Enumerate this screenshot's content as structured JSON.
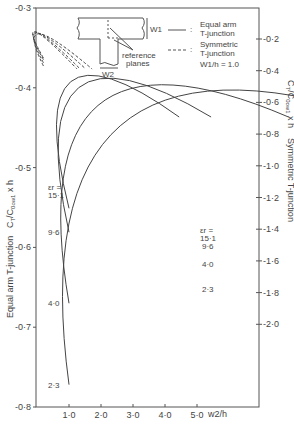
{
  "chart_data": {
    "type": "line",
    "title": "",
    "xlabel": "w2/h",
    "ylabel": "Equal arm T-junction  CT/C0ow1 x h",
    "ylabel_right": "Symmetric T-junction  CT/C0ow1 x h",
    "x_ticks": [
      "1.0",
      "2.0",
      "3.0",
      "4.0",
      "5.0"
    ],
    "y_ticks_left": [
      "-0.3",
      "-0.4",
      "-0.5",
      "-0.6",
      "-0.7",
      "-0.8"
    ],
    "y_ticks_right": [
      "-0.2",
      "-0.4",
      "-0.6",
      "-0.8",
      "-1.0",
      "-1.2",
      "-1.4",
      "-1.6",
      "-1.8",
      "-2.0"
    ],
    "ylim_left": [
      -0.8,
      -0.3
    ],
    "ylim_right": [
      -2.3,
      -0.0
    ],
    "xlim": [
      0,
      6.9
    ],
    "grid": false,
    "legend": [
      {
        "style": "solid",
        "label": "Equal arm T-junction"
      },
      {
        "style": "dashed",
        "label": "Symmetric T-junction"
      }
    ],
    "legend_note": "W1/h = 1.0",
    "eps_label": "εr =",
    "series": [
      {
        "name": "Equal arm εr=15.1",
        "axis": "left",
        "style": "solid",
        "x": [
          1.0,
          2.5,
          4.0
        ],
        "y": [
          -0.551,
          -0.478,
          -0.424
        ]
      },
      {
        "name": "Equal arm εr=9.6",
        "axis": "left",
        "style": "solid",
        "x": [
          1.0,
          2.5,
          4.0
        ],
        "y": [
          -0.581,
          -0.528,
          -0.489
        ]
      },
      {
        "name": "Equal arm εr=4.0",
        "axis": "left",
        "style": "solid",
        "x": [
          1.0,
          2.5,
          4.0
        ],
        "y": [
          -0.67,
          -0.633,
          -0.612
        ]
      },
      {
        "name": "Equal arm εr=2.3",
        "axis": "left",
        "style": "solid",
        "x": [
          1.0,
          2.5,
          4.0
        ],
        "y": [
          -0.772,
          -0.754,
          -0.742
        ]
      },
      {
        "name": "Symmetric εr=15.1",
        "axis": "right",
        "style": "dashed",
        "x": [
          0.2,
          1.0,
          2.0,
          3.0,
          4.0,
          5.0
        ],
        "y": [
          -0.32,
          -0.56,
          -0.84,
          -1.08,
          -1.29,
          -1.47
        ]
      },
      {
        "name": "Symmetric εr=9.6",
        "axis": "right",
        "style": "dashed",
        "x": [
          0.2,
          1.0,
          2.0,
          3.0,
          4.0,
          5.0
        ],
        "y": [
          -0.33,
          -0.59,
          -0.88,
          -1.12,
          -1.33,
          -1.52
        ]
      },
      {
        "name": "Symmetric εr=4.0",
        "axis": "right",
        "style": "dashed",
        "x": [
          0.2,
          1.0,
          2.0,
          3.0,
          4.0,
          5.0
        ],
        "y": [
          -0.35,
          -0.64,
          -0.95,
          -1.21,
          -1.43,
          -1.63
        ]
      },
      {
        "name": "Symmetric εr=2.3",
        "axis": "right",
        "style": "dashed",
        "x": [
          0.2,
          1.0,
          2.0,
          3.0,
          4.0,
          5.0
        ],
        "y": [
          -0.37,
          -0.7,
          -1.04,
          -1.33,
          -1.57,
          -1.78
        ]
      }
    ],
    "curve_labels_left": [
      "εr =",
      "15.1",
      "9.6",
      "4.0",
      "2.3"
    ],
    "curve_labels_right": [
      "εr =",
      "15.1",
      "9.6",
      "4.0",
      "2.3"
    ],
    "inset": {
      "w1_label": "W1",
      "w2_label": "W2",
      "planes_label": "reference planes"
    }
  }
}
